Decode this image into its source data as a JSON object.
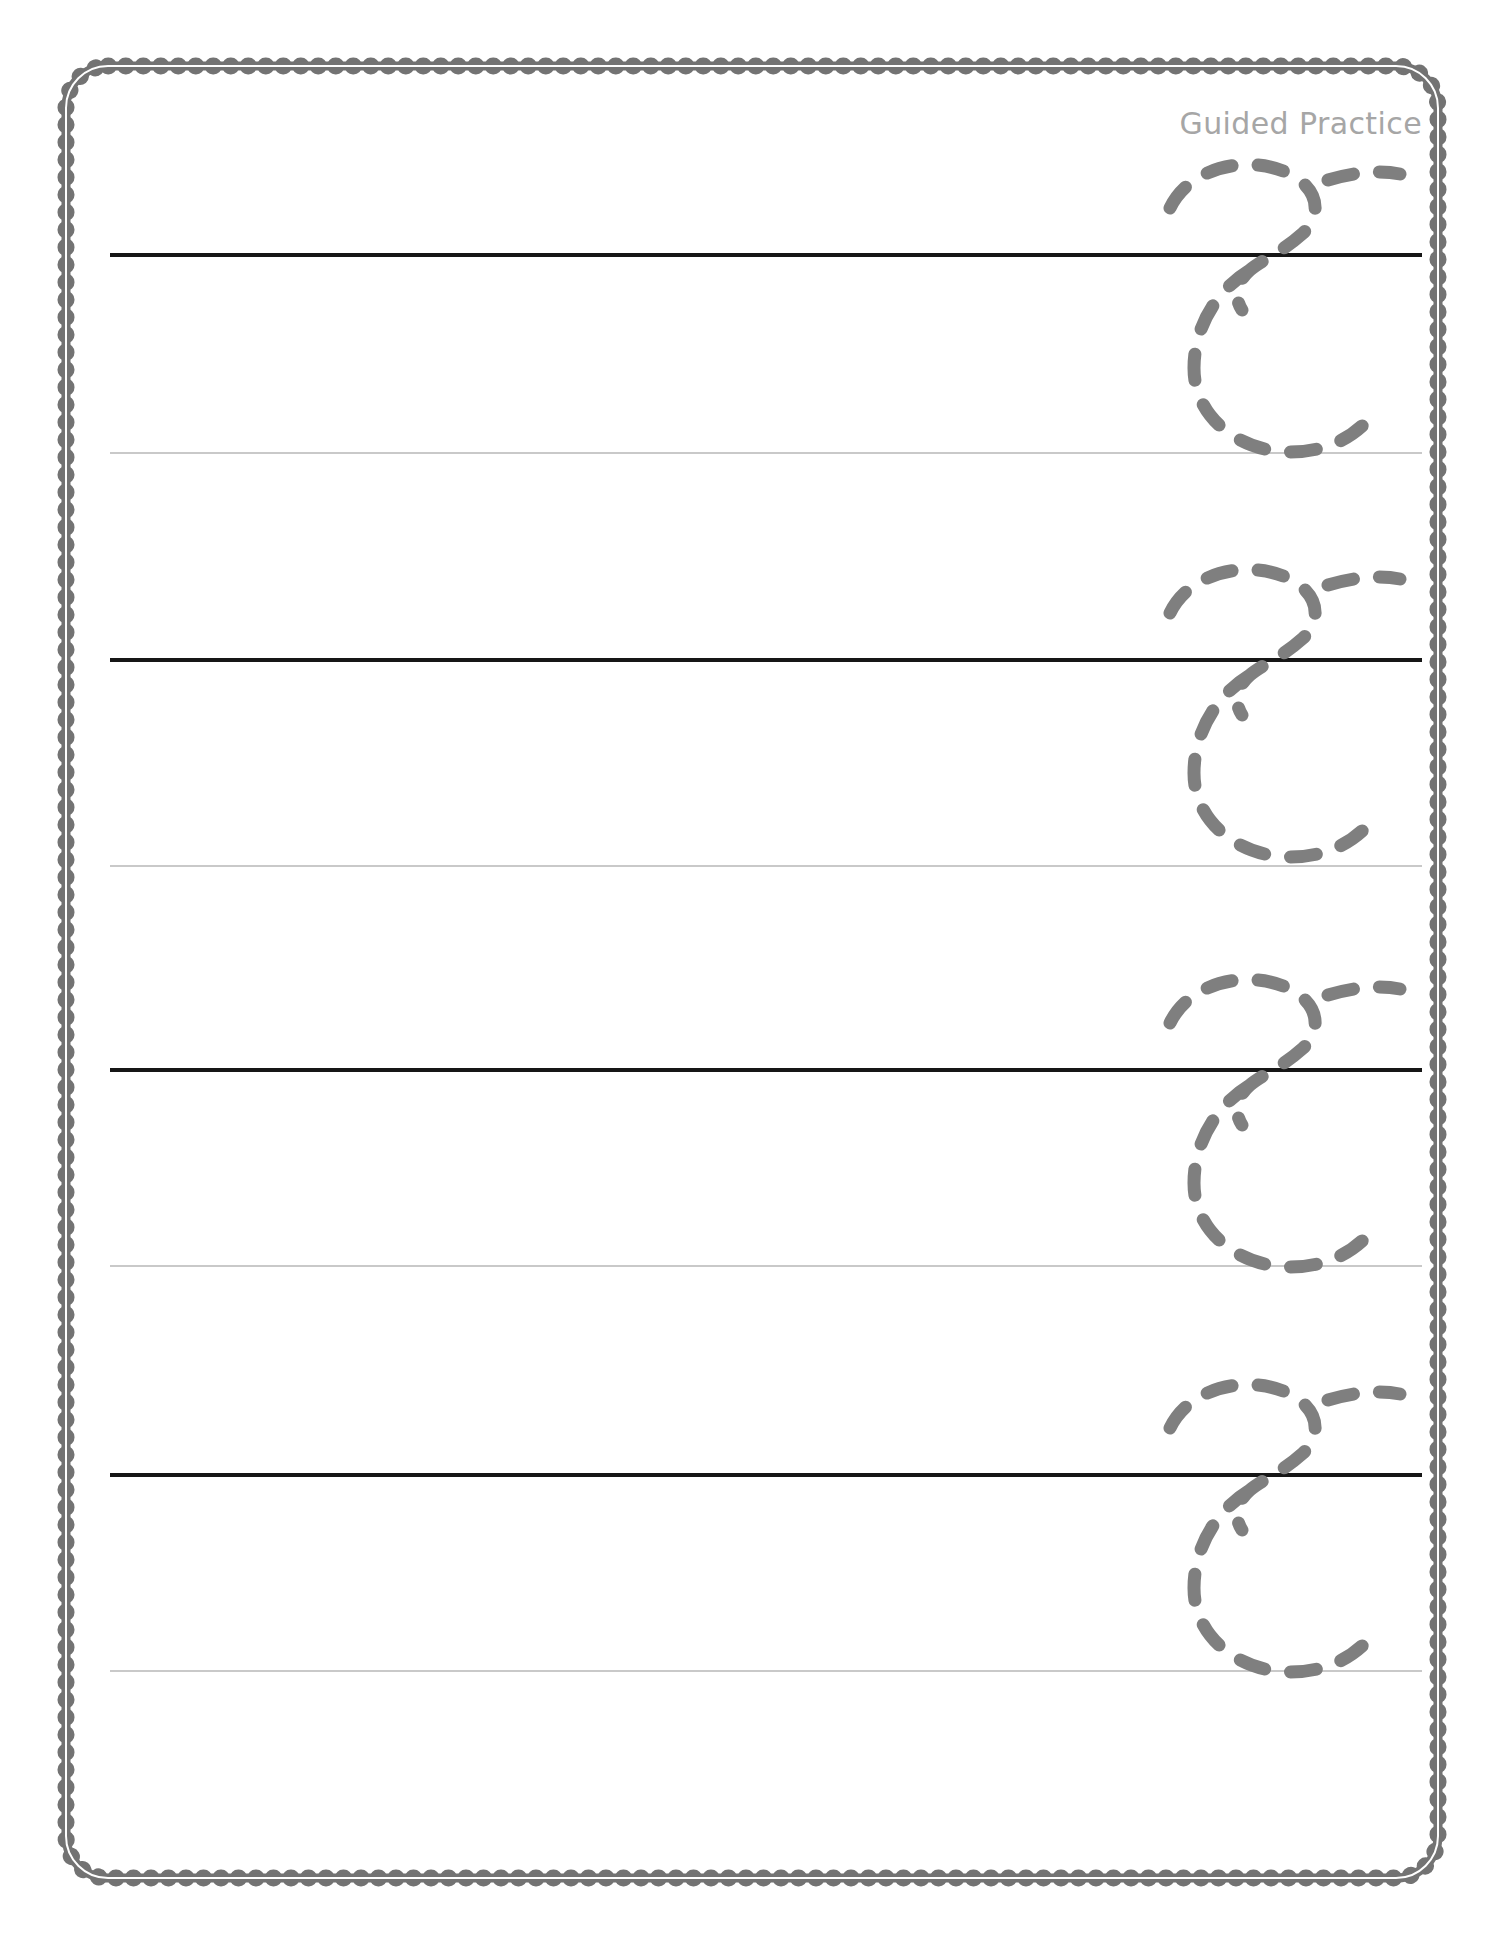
{
  "page": {
    "title": "Guided Practice",
    "kind": "handwriting-tracing-worksheet",
    "background_color": "#ffffff",
    "width": 1496,
    "height": 1941
  },
  "header": {
    "label": "Guided Practice",
    "color": "#a6a6a6",
    "align": "right"
  },
  "border": {
    "style": "scalloped",
    "color": "#737373",
    "shape": "rounded-rectangle",
    "scallop_radius": 9,
    "corner_radius": 46
  },
  "practice": {
    "letter": "c",
    "letter_case": "lowercase",
    "script": "cursive",
    "guide_style": "dashed-trace",
    "guide_color": "#7f7f7f",
    "row_count": 4,
    "lines": {
      "midline_color": "#161616",
      "midline_thickness": 4,
      "baseline_color": "#c9c9c9",
      "baseline_thickness": 2,
      "line_left": 110,
      "line_width": 1312
    },
    "rows": [
      {
        "index": 1,
        "midline_y": 253,
        "baseline_y": 452,
        "letter_left": 1132,
        "letter_top": 140,
        "letter_label": "c"
      },
      {
        "index": 2,
        "midline_y": 658,
        "baseline_y": 865,
        "letter_left": 1132,
        "letter_top": 545,
        "letter_label": "c"
      },
      {
        "index": 3,
        "midline_y": 1068,
        "baseline_y": 1265,
        "letter_left": 1132,
        "letter_top": 955,
        "letter_label": "c"
      },
      {
        "index": 4,
        "midline_y": 1473,
        "baseline_y": 1670,
        "letter_left": 1132,
        "letter_top": 1360,
        "letter_label": "c"
      }
    ]
  }
}
